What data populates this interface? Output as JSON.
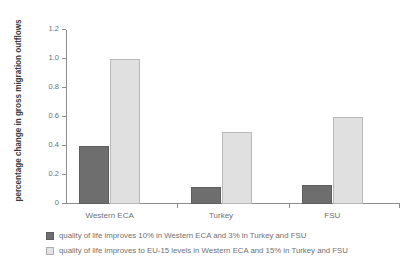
{
  "chart_data": {
    "type": "bar",
    "title": "",
    "xlabel": "",
    "ylabel": "percentage change in gross migration outflows",
    "categories": [
      "Western ECA",
      "Turkey",
      "FSU"
    ],
    "series": [
      {
        "name": "quality of life improves 10% in Western ECA and 3% in Turkey and FSU",
        "color": "#6e6e6e",
        "values": [
          0.4,
          0.12,
          0.13
        ]
      },
      {
        "name": "quality of life improves to EU-15 levels in Western ECA and 15% in Turkey and FSU",
        "color": "#e0e0e0",
        "values": [
          1.0,
          0.5,
          0.6
        ]
      }
    ],
    "ylim": [
      0,
      1.2
    ],
    "yticks": [
      0,
      0.2,
      0.4,
      0.6,
      0.8,
      1.0,
      1.2
    ],
    "ytick_labels": [
      "0",
      "0.2",
      "0.4",
      "0.6",
      "0.8",
      "1.0",
      "1.2"
    ],
    "grid": false,
    "legend_position": "below"
  },
  "legend": {
    "items": [
      {
        "label": "quality of life improves 10% in Western ECA and 3% in Turkey and FSU"
      },
      {
        "label": "quality of life improves to EU-15 levels in Western ECA and 15% in Turkey and FSU"
      }
    ]
  }
}
